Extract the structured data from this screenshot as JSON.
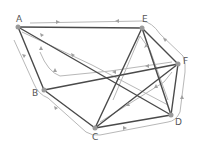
{
  "diagram": {
    "type": "graph-eulerian-route",
    "nodes": [
      {
        "id": "A",
        "label": "A"
      },
      {
        "id": "B",
        "label": "B"
      },
      {
        "id": "C",
        "label": "C"
      },
      {
        "id": "D",
        "label": "D"
      },
      {
        "id": "E",
        "label": "E"
      },
      {
        "id": "F",
        "label": "F"
      }
    ],
    "edges": [
      [
        "A",
        "E"
      ],
      [
        "A",
        "B"
      ],
      [
        "A",
        "D"
      ],
      [
        "B",
        "F"
      ],
      [
        "B",
        "C"
      ],
      [
        "C",
        "E"
      ],
      [
        "C",
        "F"
      ],
      [
        "C",
        "D"
      ],
      [
        "E",
        "F"
      ],
      [
        "E",
        "D"
      ],
      [
        "F",
        "D"
      ]
    ],
    "route_description": "Grey arrowed path tracing every edge once",
    "colors": {
      "edge": "#4a4a4a",
      "route": "#b8b8b8",
      "node": "#9a9a9a"
    }
  }
}
